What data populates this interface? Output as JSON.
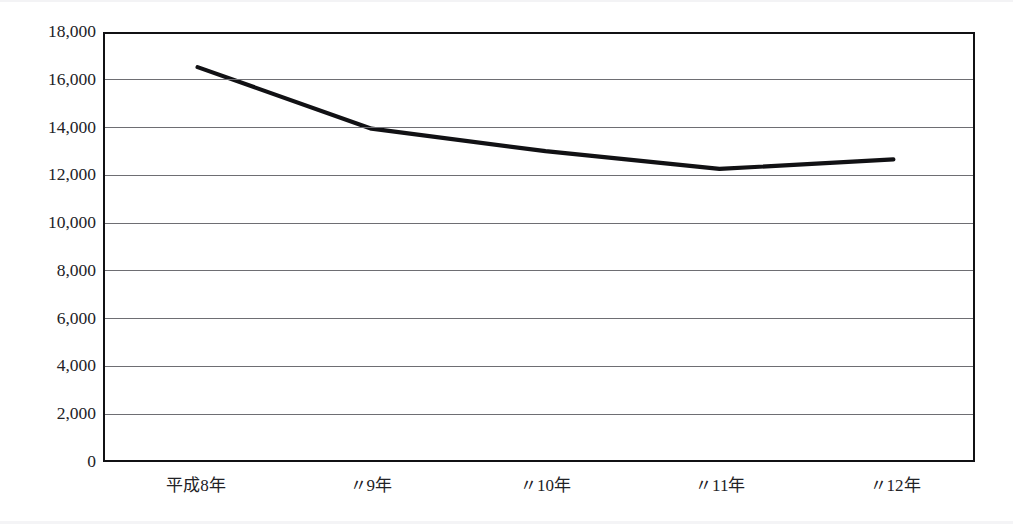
{
  "chart_data": {
    "type": "line",
    "title": "",
    "xlabel": "",
    "ylabel": "",
    "categories": [
      "平成8年",
      "〃9年",
      "〃10年",
      "〃11年",
      "〃12年"
    ],
    "values": [
      16600,
      14000,
      13050,
      12300,
      12700
    ],
    "series": [
      {
        "name": "件数",
        "values": [
          16600,
          14000,
          13050,
          12300,
          12700
        ]
      }
    ],
    "ylim": [
      0,
      18000
    ],
    "ytick_step": 2000,
    "ytick_labels": [
      "18,000",
      "16,000",
      "14,000",
      "12,000",
      "10,000",
      "8,000",
      "6,000",
      "4,000",
      "2,000",
      "0"
    ],
    "ytick_values": [
      18000,
      16000,
      14000,
      12000,
      10000,
      8000,
      6000,
      4000,
      2000,
      0
    ],
    "grid": true,
    "grid_axis": "y",
    "legend": false,
    "legend_position": "none",
    "line_color": "#111114",
    "grid_color": "#6e6e73",
    "frame_color": "#111114",
    "background_color": "#ffffff",
    "markers": false,
    "annotations": []
  },
  "axes": {
    "y_axis_name": "y-axis",
    "x_axis_name": "x-axis"
  }
}
